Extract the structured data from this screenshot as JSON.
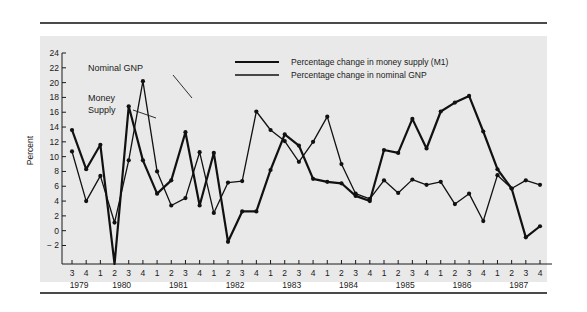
{
  "figure": {
    "background_color": "#e9e9e9",
    "page_color": "#ffffff",
    "rule_color": "#4a4a4a",
    "series_color": "#111111"
  },
  "annotations": {
    "nominal_gnp": "Nominal GNP",
    "money_supply_line1": "Money",
    "money_supply_line2": "Supply"
  },
  "legend": {
    "position": "top-center",
    "items": [
      {
        "label": "Percentage change in money supply (M1)",
        "color": "#111111",
        "width": 2.2
      },
      {
        "label": "Percentage change in nominal GNP",
        "color": "#111111",
        "width": 1.3
      }
    ]
  },
  "chart_data": {
    "type": "line",
    "title": "",
    "xlabel": "",
    "ylabel": "Percent",
    "ylim": [
      -4.5,
      24
    ],
    "yticks": [
      -2,
      0,
      2,
      4,
      6,
      8,
      10,
      12,
      14,
      16,
      18,
      20,
      22,
      24
    ],
    "ytick_labels": [
      "− 2",
      "0",
      "2",
      "4",
      "6",
      "8",
      "10",
      "12",
      "14",
      "16",
      "18",
      "20",
      "22",
      "24"
    ],
    "grid": false,
    "legend_position": "top-center",
    "x": [
      "1979 Q3",
      "1979 Q4",
      "1980 Q1",
      "1980 Q2",
      "1980 Q3",
      "1980 Q4",
      "1981 Q1",
      "1981 Q2",
      "1981 Q3",
      "1981 Q4",
      "1982 Q1",
      "1982 Q2",
      "1982 Q3",
      "1982 Q4",
      "1983 Q1",
      "1983 Q2",
      "1983 Q3",
      "1983 Q4",
      "1984 Q1",
      "1984 Q2",
      "1984 Q3",
      "1984 Q4",
      "1985 Q1",
      "1985 Q2",
      "1985 Q3",
      "1985 Q4",
      "1986 Q1",
      "1986 Q2",
      "1986 Q3",
      "1986 Q4",
      "1987 Q1",
      "1987 Q2",
      "1987 Q3",
      "1987 Q4"
    ],
    "quarter_labels": [
      "3",
      "4",
      "1",
      "2",
      "3",
      "4",
      "1",
      "2",
      "3",
      "4",
      "1",
      "2",
      "3",
      "4",
      "1",
      "2",
      "3",
      "4",
      "1",
      "2",
      "3",
      "4",
      "1",
      "2",
      "3",
      "4",
      "1",
      "2",
      "3",
      "4",
      "1",
      "2",
      "3",
      "4"
    ],
    "year_labels": [
      "1979",
      "1980",
      "1981",
      "1982",
      "1983",
      "1984",
      "1985",
      "1986",
      "1987"
    ],
    "year_first_index": [
      0,
      2,
      6,
      10,
      14,
      18,
      22,
      26,
      30
    ],
    "series": [
      {
        "name": "Percentage change in money supply (M1)",
        "values": [
          13.6,
          8.3,
          11.6,
          -4.5,
          16.8,
          9.5,
          5.0,
          6.8,
          13.3,
          3.4,
          10.5,
          -1.5,
          2.6,
          2.6,
          8.2,
          13.0,
          11.5,
          7.0,
          6.6,
          6.4,
          4.7,
          4.0,
          10.9,
          10.5,
          15.1,
          11.1,
          16.1,
          17.3,
          18.2,
          13.4,
          8.3,
          5.7,
          -0.9,
          0.6
        ]
      },
      {
        "name": "Percentage change in nominal GNP",
        "values": [
          10.7,
          4.0,
          7.4,
          1.1,
          9.5,
          20.2,
          8.0,
          3.4,
          4.4,
          10.6,
          2.4,
          6.5,
          6.7,
          16.1,
          13.6,
          12.1,
          9.3,
          12.0,
          15.4,
          9.0,
          5.0,
          4.3,
          6.8,
          5.1,
          6.9,
          6.2,
          6.6,
          3.6,
          5.0,
          1.3,
          7.5,
          5.7,
          6.8,
          6.2
        ]
      }
    ]
  }
}
